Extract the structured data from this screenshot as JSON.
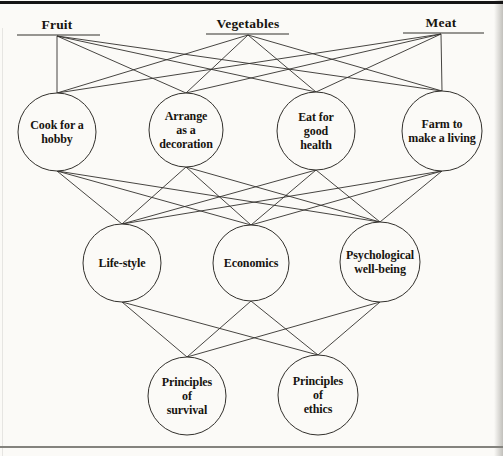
{
  "figure": {
    "paper_color": "#fbfaf7",
    "line_color": "#32302c",
    "text_color": "#17140f",
    "top_border_color": "#151515",
    "bottom_border_color": "#84837e",
    "edge_stroke_width": 0.9,
    "circle_stroke_width": 1,
    "underline_stroke_width": 1.2
  },
  "diagram": {
    "top_labels": [
      {
        "id": "fruit",
        "label": "Fruit",
        "x": 57,
        "anchor_y": 36,
        "underline": {
          "x1": 17,
          "x2": 100,
          "y": 35
        }
      },
      {
        "id": "vegetables",
        "label": "Vegetables",
        "x": 248,
        "anchor_y": 35,
        "underline": {
          "x1": 206,
          "x2": 289,
          "y": 34
        }
      },
      {
        "id": "meat",
        "label": "Meat",
        "x": 441,
        "anchor_y": 34,
        "underline": {
          "x1": 403,
          "x2": 484,
          "y": 33
        }
      }
    ],
    "nodes": [
      {
        "id": "cook",
        "label": "Cook for a\nhobby",
        "cx": 57,
        "cy": 132,
        "r": 39
      },
      {
        "id": "arrange",
        "label": "Arrange\nas a\ndecoration",
        "cx": 186,
        "cy": 130,
        "r": 37
      },
      {
        "id": "eat",
        "label": "Eat for\ngood\nhealth",
        "cx": 316,
        "cy": 131,
        "r": 39
      },
      {
        "id": "farm",
        "label": "Farm to\nmake a living",
        "cx": 442,
        "cy": 131,
        "r": 40
      },
      {
        "id": "lifestyle",
        "label": "Life-style",
        "cx": 122,
        "cy": 263,
        "r": 39
      },
      {
        "id": "economics",
        "label": "Economics",
        "cx": 251,
        "cy": 263,
        "r": 38
      },
      {
        "id": "psychological",
        "label": "Psychological\nwell-being",
        "cx": 380,
        "cy": 262,
        "r": 40
      },
      {
        "id": "survival",
        "label": "Principles\nof\nsurvival",
        "cx": 187,
        "cy": 396,
        "r": 39
      },
      {
        "id": "ethics",
        "label": "Principles\nof\nethics",
        "cx": 318,
        "cy": 395,
        "r": 40
      }
    ],
    "edges": [
      [
        "fruit",
        "cook"
      ],
      [
        "fruit",
        "arrange"
      ],
      [
        "fruit",
        "eat"
      ],
      [
        "fruit",
        "farm"
      ],
      [
        "vegetables",
        "cook"
      ],
      [
        "vegetables",
        "arrange"
      ],
      [
        "vegetables",
        "eat"
      ],
      [
        "vegetables",
        "farm"
      ],
      [
        "meat",
        "cook"
      ],
      [
        "meat",
        "arrange"
      ],
      [
        "meat",
        "eat"
      ],
      [
        "meat",
        "farm"
      ],
      [
        "cook",
        "lifestyle"
      ],
      [
        "cook",
        "economics"
      ],
      [
        "cook",
        "psychological"
      ],
      [
        "arrange",
        "lifestyle"
      ],
      [
        "arrange",
        "economics"
      ],
      [
        "arrange",
        "psychological"
      ],
      [
        "eat",
        "lifestyle"
      ],
      [
        "eat",
        "economics"
      ],
      [
        "eat",
        "psychological"
      ],
      [
        "farm",
        "lifestyle"
      ],
      [
        "farm",
        "economics"
      ],
      [
        "farm",
        "psychological"
      ],
      [
        "lifestyle",
        "survival"
      ],
      [
        "lifestyle",
        "ethics"
      ],
      [
        "economics",
        "survival"
      ],
      [
        "economics",
        "ethics"
      ],
      [
        "psychological",
        "survival"
      ],
      [
        "psychological",
        "ethics"
      ]
    ]
  }
}
